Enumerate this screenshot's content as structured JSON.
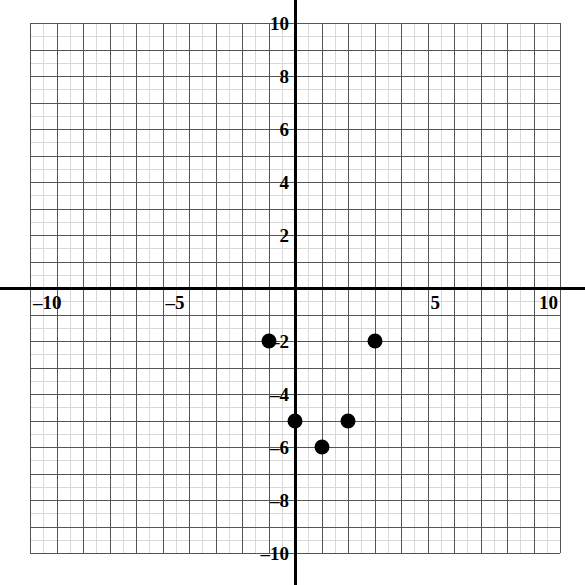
{
  "chart_data": {
    "type": "scatter",
    "title": "",
    "xlabel": "",
    "ylabel": "",
    "xlim": [
      -10,
      10
    ],
    "ylim": [
      -10,
      10
    ],
    "grid": true,
    "grid_major_step": 1,
    "grid_minor_step": 0.5,
    "legend": "none",
    "x_ticks": [
      -10,
      -5,
      5,
      10
    ],
    "y_ticks": [
      10,
      8,
      6,
      4,
      2,
      -2,
      -4,
      -6,
      -8,
      -10
    ],
    "x_tick_labels": [
      "–10",
      "–5",
      "5",
      "10"
    ],
    "y_tick_labels": [
      "10",
      "8",
      "6",
      "4",
      "2",
      "–2",
      "–4",
      "–6",
      "–8",
      "–10"
    ],
    "point_color": "#000000",
    "axis_color": "#000000",
    "grid_major_color": "#555555",
    "grid_minor_color": "#d8d8d8",
    "points": [
      {
        "x": -1,
        "y": -2,
        "label": "(-1, -2)"
      },
      {
        "x": 3,
        "y": -2,
        "label": "(3, -2)"
      },
      {
        "x": 0,
        "y": -5,
        "label": "(0, -5)"
      },
      {
        "x": 2,
        "y": -5,
        "label": "(2, -5)"
      },
      {
        "x": 1,
        "y": -6,
        "label": "(1, -6)"
      }
    ]
  }
}
